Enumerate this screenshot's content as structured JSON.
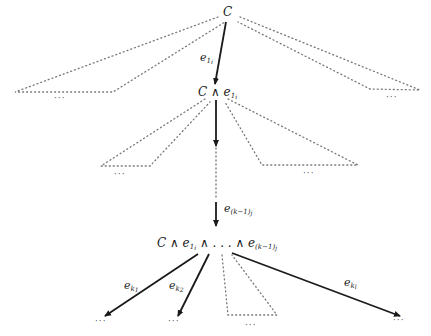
{
  "diagram": {
    "type": "search-tree",
    "colors": {
      "edge": "#1a1a1a",
      "dotted": "#777777",
      "text": "#1a1a1a"
    },
    "nodes": {
      "root": {
        "label": "C"
      },
      "level1": {
        "label_main": "C ∧ e",
        "sub1": "1",
        "sub2": "i"
      },
      "ellipsis_vertical": "⋮",
      "level_k": {
        "label_prefix": "C ∧ e",
        "sub1": "1",
        "sub2": "i",
        "middle": " ∧ . . . ∧ e",
        "sub_k": "(k−1)",
        "sub_j": "j"
      }
    },
    "edges": {
      "e1i": {
        "base": "e",
        "sub1": "1",
        "sub2": "i"
      },
      "ek1j": {
        "base": "e",
        "sub1": "(k−1)",
        "sub2": "j"
      },
      "ek1": {
        "base": "e",
        "sub1": "k",
        "sub2": "1"
      },
      "ek2": {
        "base": "e",
        "sub1": "k",
        "sub2": "2"
      },
      "ekl": {
        "base": "e",
        "sub1": "k",
        "sub2": "l"
      }
    },
    "ellipses": {
      "root_left": "···",
      "root_right": "···",
      "l1_left": "···",
      "l1_right": "···",
      "leaf_k1": "···",
      "leaf_k2": "···",
      "leaf_mid": "···",
      "leaf_kl": "···"
    }
  }
}
